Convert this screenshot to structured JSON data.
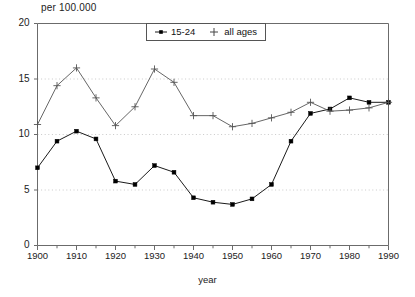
{
  "chart_data": {
    "type": "line",
    "title": "",
    "ylabel": "per 100.000",
    "xlabel": "year",
    "xlim": [
      1900,
      1990
    ],
    "ylim": [
      0,
      20
    ],
    "xticks": [
      1900,
      1910,
      1920,
      1930,
      1940,
      1950,
      1960,
      1970,
      1980,
      1990
    ],
    "yticks": [
      0,
      5,
      10,
      15,
      20
    ],
    "minor_xtick_step": 5,
    "grid": "horizontal-dotted",
    "legend_position": "top-center",
    "x": [
      1900,
      1905,
      1910,
      1915,
      1920,
      1925,
      1930,
      1935,
      1940,
      1945,
      1950,
      1955,
      1960,
      1965,
      1970,
      1975,
      1980,
      1985,
      1990
    ],
    "series": [
      {
        "name": "15-24",
        "marker": "square",
        "color": "#000000",
        "values": [
          7.0,
          9.4,
          10.3,
          9.6,
          5.8,
          5.5,
          7.2,
          6.6,
          4.3,
          3.9,
          3.7,
          4.2,
          5.5,
          9.4,
          11.9,
          12.3,
          13.3,
          12.9,
          12.9
        ]
      },
      {
        "name": "all ages",
        "marker": "plus",
        "color": "#555555",
        "values": [
          10.9,
          14.4,
          16.0,
          13.3,
          10.8,
          12.5,
          15.9,
          14.7,
          11.7,
          11.7,
          10.7,
          11.0,
          11.5,
          12.0,
          12.9,
          12.1,
          12.2,
          12.4,
          12.9
        ]
      }
    ]
  },
  "legend": {
    "items": [
      {
        "label": "15-24",
        "marker": "square"
      },
      {
        "label": "all ages",
        "marker": "plus"
      }
    ]
  },
  "axes": {
    "y_tick_labels": [
      "0",
      "5",
      "10",
      "15",
      "20"
    ],
    "x_tick_labels": [
      "1900",
      "1910",
      "1920",
      "1930",
      "1940",
      "1950",
      "1960",
      "1970",
      "1980",
      "1990"
    ],
    "y_axis_title": "per 100.000",
    "x_axis_title": "year"
  }
}
